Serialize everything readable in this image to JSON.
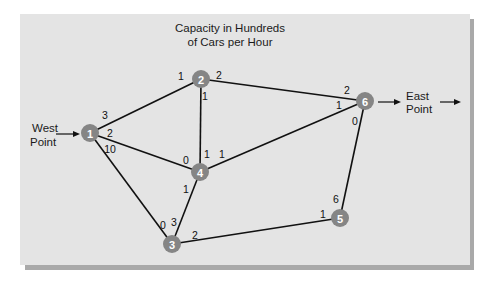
{
  "title": {
    "line1": "Capacity in Hundreds",
    "line2": "of Cars per Hour"
  },
  "source": {
    "line1": "West",
    "line2": "Point"
  },
  "sink": {
    "line1": "East",
    "line2": "Point"
  },
  "colors": {
    "panel": "#e4e4e4",
    "panel_shadow": "#a9a9a9",
    "node_fill": "#858585",
    "node_text": "#ffffff",
    "edge": "#111111"
  },
  "nodes": [
    {
      "id": "1",
      "x": 90,
      "y": 133
    },
    {
      "id": "2",
      "x": 201,
      "y": 79
    },
    {
      "id": "3",
      "x": 172,
      "y": 244
    },
    {
      "id": "4",
      "x": 200,
      "y": 172
    },
    {
      "id": "5",
      "x": 340,
      "y": 218
    },
    {
      "id": "6",
      "x": 365,
      "y": 101
    }
  ],
  "edges": [
    {
      "from": "1",
      "to": "2",
      "cap_from": "3",
      "cap_to": "1"
    },
    {
      "from": "1",
      "to": "4",
      "cap_from": "2",
      "cap_to": "0"
    },
    {
      "from": "1",
      "to": "3",
      "cap_from": "10",
      "cap_to": "0"
    },
    {
      "from": "2",
      "to": "4",
      "cap_from": "1",
      "cap_to": "1"
    },
    {
      "from": "2",
      "to": "6",
      "cap_from": "2",
      "cap_to": "2"
    },
    {
      "from": "4",
      "to": "6",
      "cap_from": "1",
      "cap_to": "1"
    },
    {
      "from": "4",
      "to": "3",
      "cap_from": "1",
      "cap_to": "3"
    },
    {
      "from": "3",
      "to": "5",
      "cap_from": "2",
      "cap_to": "1"
    },
    {
      "from": "6",
      "to": "5",
      "cap_from": "0",
      "cap_to": "6"
    }
  ],
  "capacity_labels": [
    {
      "edge": "1-2",
      "end": "1",
      "text": "3",
      "x": 105,
      "y": 115
    },
    {
      "edge": "1-2",
      "end": "2",
      "text": "1",
      "x": 181,
      "y": 76
    },
    {
      "edge": "1-4",
      "end": "1",
      "text": "2",
      "x": 110,
      "y": 133
    },
    {
      "edge": "1-4",
      "end": "4",
      "text": "0",
      "x": 186,
      "y": 160
    },
    {
      "edge": "1-3",
      "end": "1",
      "text": "10",
      "x": 110,
      "y": 149
    },
    {
      "edge": "1-3",
      "end": "3",
      "text": "0",
      "x": 163,
      "y": 225
    },
    {
      "edge": "2-4",
      "end": "2",
      "text": "1",
      "x": 205,
      "y": 96
    },
    {
      "edge": "2-4",
      "end": "4",
      "text": "1",
      "x": 207,
      "y": 154
    },
    {
      "edge": "2-6",
      "end": "2",
      "text": "2",
      "x": 219,
      "y": 75
    },
    {
      "edge": "2-6",
      "end": "6",
      "text": "2",
      "x": 347,
      "y": 90
    },
    {
      "edge": "4-6",
      "end": "4",
      "text": "1",
      "x": 222,
      "y": 154
    },
    {
      "edge": "4-6",
      "end": "6",
      "text": "1",
      "x": 339,
      "y": 105
    },
    {
      "edge": "4-3",
      "end": "4",
      "text": "1",
      "x": 186,
      "y": 189
    },
    {
      "edge": "4-3",
      "end": "3",
      "text": "3",
      "x": 174,
      "y": 222
    },
    {
      "edge": "3-5",
      "end": "3",
      "text": "2",
      "x": 195,
      "y": 235
    },
    {
      "edge": "3-5",
      "end": "5",
      "text": "1",
      "x": 323,
      "y": 214
    },
    {
      "edge": "6-5",
      "end": "6",
      "text": "0",
      "x": 355,
      "y": 121
    },
    {
      "edge": "6-5",
      "end": "5",
      "text": "6",
      "x": 336,
      "y": 199
    }
  ]
}
